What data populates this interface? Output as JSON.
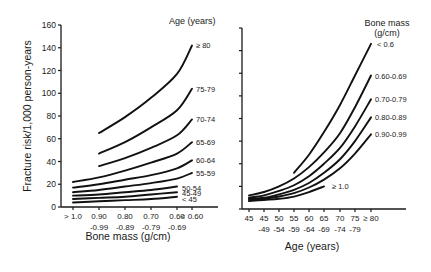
{
  "chart_data": [
    {
      "type": "line",
      "title": "",
      "xlabel": "Bone mass (g/cm)",
      "ylabel": "Fracture risk/1,000 person-years",
      "ylim": [
        0,
        160
      ],
      "yticks": [
        0,
        20,
        40,
        60,
        80,
        100,
        120,
        140,
        160
      ],
      "grid": false,
      "legend_title": "Age (years)",
      "legend_position": "right, inline labels",
      "categories": [
        "> 1.0",
        "0.90-0.99",
        "0.80-0.89",
        "0.70-0.79",
        "0.60-0.69",
        "< 0.60"
      ],
      "category_labels": [
        {
          "line1": "> 1.0",
          "line2": ""
        },
        {
          "line1": "0.90",
          "line2": "-0.99"
        },
        {
          "line1": "0.80",
          "line2": "-0.89"
        },
        {
          "line1": "0.70",
          "line2": "-0.79"
        },
        {
          "line1": "0.60",
          "line2": "-0.69"
        },
        {
          "line1": "< 0.60",
          "line2": ""
        }
      ],
      "series": [
        {
          "name": "≥ 80",
          "values": [
            null,
            65,
            79,
            96,
            117,
            142
          ]
        },
        {
          "name": "75-79",
          "values": [
            null,
            47,
            57,
            70,
            85,
            104
          ]
        },
        {
          "name": "70-74",
          "values": [
            null,
            36,
            43,
            52,
            63,
            77
          ]
        },
        {
          "name": "65-69",
          "values": [
            22,
            26,
            32,
            39,
            47,
            57
          ]
        },
        {
          "name": "60-64",
          "values": [
            17,
            20,
            24,
            28,
            34,
            41
          ]
        },
        {
          "name": "55-59",
          "values": [
            13,
            15,
            18,
            21,
            25,
            30
          ]
        },
        {
          "name": "50-54",
          "values": [
            10,
            11,
            13,
            15,
            18,
            null
          ]
        },
        {
          "name": "45-49",
          "values": [
            7,
            8,
            9,
            11,
            13,
            null
          ]
        },
        {
          "name": "< 45",
          "values": [
            4,
            5,
            6,
            7,
            9,
            null
          ]
        }
      ]
    },
    {
      "type": "line",
      "title": "",
      "xlabel": "Age (years)",
      "ylabel": "",
      "ylim": [
        0,
        160
      ],
      "grid": false,
      "legend_title": "Bone mass (g/cm)",
      "legend_position": "right, inline labels",
      "categories": [
        "45",
        "45-49",
        "50-54",
        "55-59",
        "60-64",
        "65-69",
        "70-74",
        "75-79",
        "≥ 80"
      ],
      "category_labels": [
        {
          "line1": "45",
          "line2": ""
        },
        {
          "line1": "45",
          "line2": "-49"
        },
        {
          "line1": "50",
          "line2": "-54"
        },
        {
          "line1": "55",
          "line2": "-59"
        },
        {
          "line1": "60",
          "line2": "-64"
        },
        {
          "line1": "65",
          "line2": "-69"
        },
        {
          "line1": "70",
          "line2": "-74"
        },
        {
          "line1": "75",
          "line2": "-79"
        },
        {
          "line1": "≥ 80",
          "line2": ""
        }
      ],
      "series": [
        {
          "name": "< 0.6",
          "values": [
            null,
            null,
            null,
            32,
            48,
            68,
            92,
            118,
            146
          ]
        },
        {
          "name": "0.60-0.69",
          "values": [
            12,
            15,
            20,
            27,
            37,
            50,
            67,
            90,
            118
          ]
        },
        {
          "name": "0.70-0.79",
          "values": [
            10,
            12,
            16,
            21,
            29,
            40,
            54,
            73,
            97
          ]
        },
        {
          "name": "0.80-0.89",
          "values": [
            9,
            10,
            13,
            17,
            23,
            32,
            44,
            60,
            81
          ]
        },
        {
          "name": "0.90-0.99",
          "values": [
            8,
            9,
            11,
            14,
            19,
            26,
            36,
            49,
            66
          ]
        },
        {
          "name": "≥ 1.0",
          "values": [
            7,
            8,
            9,
            11,
            15,
            20,
            null,
            null,
            null
          ]
        }
      ]
    }
  ]
}
